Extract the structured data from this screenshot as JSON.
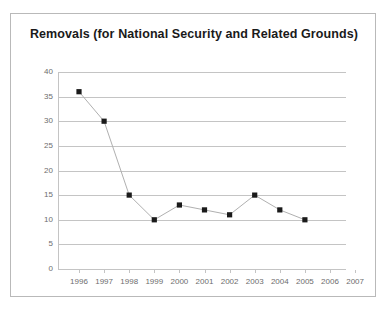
{
  "chart_data": {
    "type": "line",
    "title": "Removals (for National Security and Related Grounds)",
    "xlabel": "",
    "ylabel": "",
    "categories": [
      "1996",
      "1997",
      "1998",
      "1999",
      "2000",
      "2001",
      "2002",
      "2003",
      "2004",
      "2005",
      "2006",
      "2007"
    ],
    "values": [
      36,
      30,
      15,
      10,
      13,
      12,
      11,
      15,
      12,
      10,
      null,
      null
    ],
    "series": [
      {
        "name": "Removals",
        "values": [
          36,
          30,
          15,
          10,
          13,
          12,
          11,
          15,
          12,
          10,
          null,
          null
        ]
      }
    ],
    "ylim": [
      0,
      40
    ],
    "yticks": [
      0,
      5,
      10,
      15,
      20,
      25,
      30,
      35,
      40
    ],
    "ytick_labels": [
      "0",
      "5",
      "10",
      "15",
      "20",
      "25",
      "30",
      "35",
      "40"
    ],
    "grid": true,
    "legend": "none",
    "marker": "square",
    "marker_color": "#1a1a1a",
    "line_color": "#b0b0b0",
    "gridline_color": "#c4c4c4",
    "axis_label_color": "#6d6d6d",
    "title_color": "#1a1a1a",
    "border_color": "#b9b9b9",
    "background_color": "#ffffff"
  }
}
